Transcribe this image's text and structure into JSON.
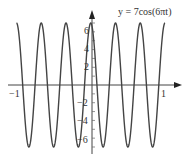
{
  "chart_data": {
    "type": "line",
    "title": "y = 7cos(6πt)",
    "xlabel": "",
    "ylabel": "",
    "xlim": [
      -1,
      1
    ],
    "ylim": [
      -7,
      7
    ],
    "x_ticks": [
      "-1",
      "1"
    ],
    "y_ticks": [
      "-6",
      "-4",
      "-2",
      "2",
      "4",
      "6"
    ],
    "grid": false,
    "series": [
      {
        "name": "y = 7cos(6πt)",
        "function": "7*cos(6*pi*t)",
        "amplitude": 7,
        "frequency": 3,
        "x": [
          -1,
          -0.833,
          -0.667,
          -0.5,
          -0.333,
          -0.167,
          0,
          0.167,
          0.333,
          0.5,
          0.667,
          0.833,
          1
        ],
        "values": [
          7,
          -7,
          7,
          -7,
          7,
          -7,
          7,
          -7,
          7,
          -7,
          7,
          -7,
          7
        ]
      }
    ],
    "color": "#444444"
  },
  "labels": {
    "title": "y = 7cos(6πt)",
    "x_neg1": "−1",
    "x_pos1": "1",
    "y6": "6",
    "y4": "4",
    "y2": "2",
    "yn2": "−2",
    "yn4": "−4",
    "yn6": "−6"
  }
}
